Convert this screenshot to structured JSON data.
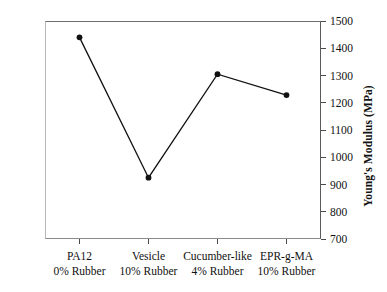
{
  "chart_data": {
    "type": "line",
    "title": "",
    "xlabel": "",
    "ylabel": "Young's Modulus (MPa)",
    "ylim": [
      700,
      1500
    ],
    "ytick_labels": [
      "1500",
      "1400",
      "1300",
      "1200",
      "1100",
      "1000",
      "900",
      "800",
      "700"
    ],
    "ytick_values": [
      1500,
      1400,
      1300,
      1200,
      1100,
      1000,
      900,
      800,
      700
    ],
    "grid": false,
    "legend": false,
    "marker": "filled-circle",
    "line_color": "#111111",
    "marker_color": "#111111",
    "categories": [
      {
        "line1": "PA12",
        "line2": "0% Rubber"
      },
      {
        "line1": "Vesicle",
        "line2": "10% Rubber"
      },
      {
        "line1": "Cucumber-like",
        "line2": "4% Rubber"
      },
      {
        "line1": "EPR-g-MA",
        "line2": "10% Rubber"
      }
    ],
    "values": [
      1440,
      925,
      1305,
      1228
    ]
  }
}
